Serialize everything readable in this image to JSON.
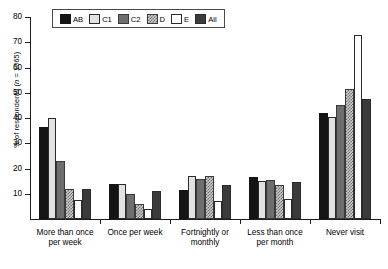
{
  "chart_data": {
    "type": "bar",
    "title": "",
    "xlabel": "",
    "ylabel": "% of respondents (n = 1065)",
    "ylabel_prefix": "% of respondents (",
    "ylabel_italic": "n",
    "ylabel_suffix": " = 1065)",
    "ylim": [
      0,
      80
    ],
    "ytick_values": [
      10,
      20,
      30,
      40,
      50,
      60,
      70,
      80
    ],
    "ytick_labels": [
      "10",
      "20",
      "30",
      "40",
      "50",
      "60",
      "70",
      "80"
    ],
    "grid": false,
    "legend_position": "top-left",
    "categories": [
      "More than once\nper week",
      "Once per week",
      "Fortnightly or\nmonthly",
      "Less than once\nper month",
      "Never visit"
    ],
    "series": [
      {
        "name": "AB",
        "color": "#141414",
        "values": [
          36.5,
          14.0,
          11.5,
          16.5,
          42.0
        ]
      },
      {
        "name": "C1",
        "color": "#e2e2e2",
        "values": [
          40.0,
          14.0,
          17.0,
          15.0,
          40.5
        ]
      },
      {
        "name": "C2",
        "color": "#6e6e6e",
        "values": [
          23.0,
          10.0,
          16.0,
          15.5,
          45.0
        ]
      },
      {
        "name": "D",
        "color": "#cfcfcf",
        "values": [
          12.0,
          6.0,
          17.0,
          13.5,
          51.5
        ]
      },
      {
        "name": "E",
        "color": "#ffffff",
        "values": [
          7.5,
          4.0,
          7.0,
          8.0,
          73.0
        ]
      },
      {
        "name": "All",
        "color": "#3b3b3b",
        "values": [
          12.0,
          11.0,
          13.5,
          14.5,
          47.5
        ]
      }
    ]
  },
  "legend": {
    "items": [
      {
        "label": "AB",
        "fill": "f-AB"
      },
      {
        "label": "C1",
        "fill": "f-C1"
      },
      {
        "label": "C2",
        "fill": "f-C2"
      },
      {
        "label": "D",
        "fill": "f-D"
      },
      {
        "label": "E",
        "fill": "f-E"
      },
      {
        "label": "All",
        "fill": "f-All"
      }
    ]
  }
}
